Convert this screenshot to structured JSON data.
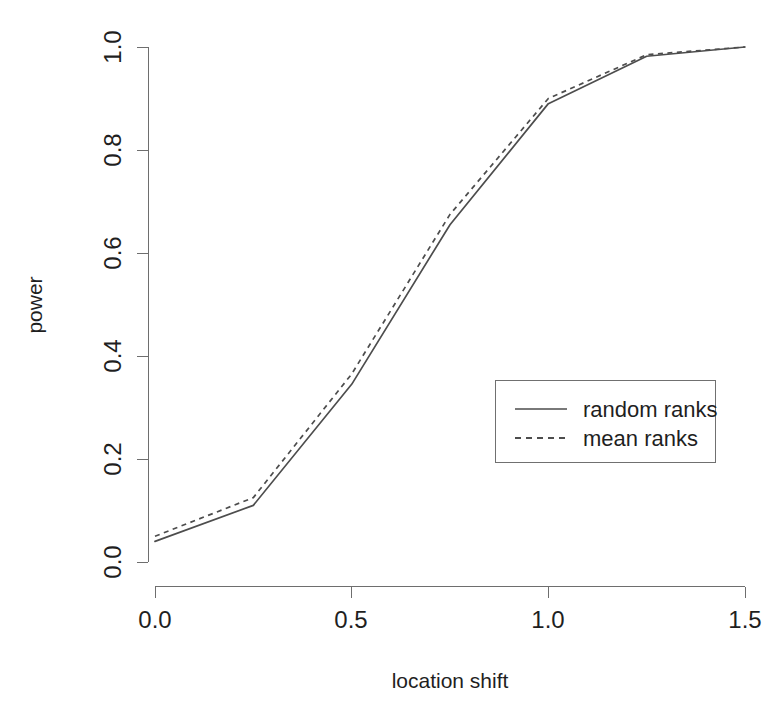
{
  "chart_data": {
    "type": "line",
    "title": "",
    "xlabel": "location shift",
    "ylabel": "power",
    "x": [
      0,
      0.25,
      0.5,
      0.75,
      1.0,
      1.25,
      1.5
    ],
    "series": [
      {
        "name": "random ranks",
        "style": "solid",
        "values": [
          0.04,
          0.11,
          0.345,
          0.655,
          0.89,
          0.982,
          1.0
        ]
      },
      {
        "name": "mean ranks",
        "style": "dashed",
        "values": [
          0.05,
          0.125,
          0.365,
          0.675,
          0.9,
          0.985,
          1.0
        ]
      }
    ],
    "xlim": [
      0,
      1.5
    ],
    "ylim": [
      0.0,
      1.0
    ],
    "xticks": [
      0.0,
      0.5,
      1.0,
      1.5
    ],
    "yticks": [
      0.0,
      0.2,
      0.4,
      0.6,
      0.8,
      1.0
    ],
    "xtick_labels": [
      "0.0",
      "0.5",
      "1.0",
      "1.5"
    ],
    "ytick_labels": [
      "0.0",
      "0.2",
      "0.4",
      "0.6",
      "0.8",
      "1.0"
    ],
    "grid": false,
    "legend_position": "center-right",
    "line_color": "#4d4d4d",
    "axis_color": "#6e6e6e",
    "background": "#ffffff"
  },
  "axes": {
    "x_title": "location shift",
    "y_title": "power"
  },
  "legend": {
    "entries": [
      {
        "label": "random ranks",
        "style": "solid"
      },
      {
        "label": "mean ranks",
        "style": "dashed"
      }
    ]
  }
}
